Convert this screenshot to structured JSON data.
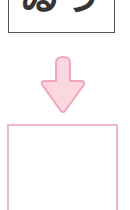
{
  "top_box": {
    "text": "ゐう"
  },
  "arrow": {
    "direction": "down",
    "fill": "#fbd7e0",
    "stroke": "#f2a6b8",
    "icon": "arrow-down-icon"
  },
  "bottom_box": {
    "text": "",
    "border_color": "#f4b6c4"
  }
}
